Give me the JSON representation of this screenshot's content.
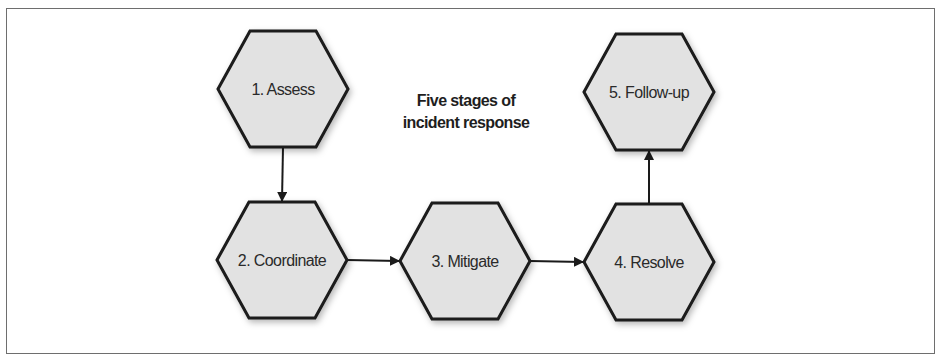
{
  "title_lines": [
    "Five stages of",
    "incident response"
  ],
  "stages": [
    {
      "id": 1,
      "label": "1. Assess"
    },
    {
      "id": 2,
      "label": "2. Coordinate"
    },
    {
      "id": 3,
      "label": "3. Mitigate"
    },
    {
      "id": 4,
      "label": "4. Resolve"
    },
    {
      "id": 5,
      "label": "5. Follow-up"
    }
  ],
  "flow": [
    {
      "from": 1,
      "to": 2
    },
    {
      "from": 2,
      "to": 3
    },
    {
      "from": 3,
      "to": 4
    },
    {
      "from": 4,
      "to": 5
    }
  ],
  "colors": {
    "hex_fill": "#e2e2e2",
    "hex_stroke": "#1a1a1a",
    "arrow": "#1a1a1a",
    "frame": "#6e6e6e"
  }
}
